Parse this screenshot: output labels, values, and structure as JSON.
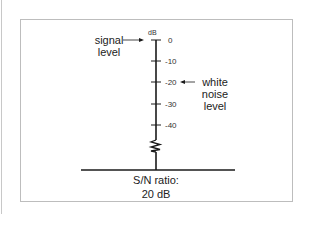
{
  "diagram": {
    "axis_unit": "dB",
    "ticks": [
      "0",
      "-10",
      "-20",
      "-30",
      "-40"
    ],
    "labels": {
      "signal_line1": "signal",
      "signal_line2": "level",
      "noise_line1": "white",
      "noise_line2": "noise",
      "noise_line3": "level",
      "ratio_line1": "S/N ratio:",
      "ratio_line2": "20 dB"
    },
    "colors": {
      "line": "#1a1a1a",
      "frame": "#bdbdbd"
    }
  }
}
